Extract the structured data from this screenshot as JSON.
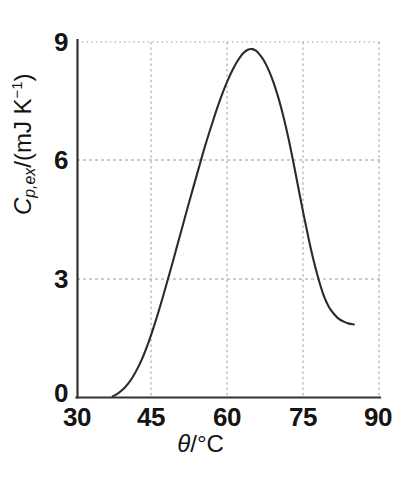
{
  "figure": {
    "background_color": "#ffffff",
    "axis_color": "#333333",
    "grid_color": "#9a9a9a",
    "curve_color": "#2b2b2b"
  },
  "axes": {
    "x_title_symbol": "θ",
    "x_title_slash": "/",
    "x_title_unit": "°C",
    "y_title_symbol": "C",
    "y_title_subscript": "p,ex",
    "y_title_slash": "/(mJ K",
    "y_title_superscript": "−1",
    "y_title_close": ")",
    "x_ticks": [
      "30",
      "45",
      "60",
      "75",
      "90"
    ],
    "y_ticks": [
      "0",
      "3",
      "6",
      "9"
    ]
  },
  "chart_data": {
    "type": "line",
    "title": "",
    "xlabel": "θ/°C",
    "ylabel": "C_p,ex/(mJ K⁻¹)",
    "xlim": [
      30,
      90
    ],
    "ylim": [
      0,
      9
    ],
    "xticks": [
      30,
      45,
      60,
      75,
      90
    ],
    "yticks": [
      0,
      3,
      6,
      9
    ],
    "grid": true,
    "grid_style": "dotted",
    "legend": null,
    "series": [
      {
        "name": "excess heat capacity",
        "x": [
          37.0,
          38.0,
          39.0,
          40.0,
          41.0,
          42.0,
          43.0,
          44.0,
          45.0,
          46.0,
          47.0,
          48.0,
          49.0,
          50.0,
          51.0,
          52.0,
          53.0,
          54.0,
          55.0,
          56.0,
          57.0,
          58.0,
          59.0,
          60.0,
          61.0,
          62.0,
          63.0,
          64.0,
          64.8,
          65.5,
          66.0,
          67.0,
          68.0,
          69.0,
          70.0,
          71.0,
          72.0,
          73.0,
          74.0,
          75.0,
          76.0,
          77.0,
          78.0,
          79.0,
          80.0,
          81.0,
          82.0,
          83.0,
          84.0,
          85.0
        ],
        "y": [
          0.03,
          0.1,
          0.2,
          0.34,
          0.52,
          0.75,
          1.02,
          1.35,
          1.72,
          2.12,
          2.55,
          3.0,
          3.45,
          3.92,
          4.38,
          4.85,
          5.3,
          5.75,
          6.2,
          6.62,
          7.02,
          7.4,
          7.75,
          8.06,
          8.33,
          8.55,
          8.72,
          8.81,
          8.82,
          8.78,
          8.72,
          8.55,
          8.3,
          7.98,
          7.58,
          7.1,
          6.55,
          5.93,
          5.28,
          4.63,
          4.02,
          3.46,
          2.98,
          2.58,
          2.3,
          2.12,
          1.99,
          1.92,
          1.87,
          1.85
        ]
      }
    ],
    "annotations": {
      "peak_x": 64.8,
      "peak_y": 8.82,
      "curve_start_x": 37.0,
      "curve_end_x": 85.0
    }
  }
}
